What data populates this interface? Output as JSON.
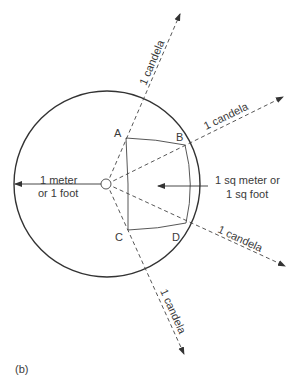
{
  "diagram": {
    "caption": "(b)",
    "points": {
      "A": "A",
      "B": "B",
      "C": "C",
      "D": "D"
    },
    "rays": [
      {
        "label": "1 candela",
        "direction": "up"
      },
      {
        "label": "1 candela",
        "direction": "upper-right"
      },
      {
        "label": "1 candela",
        "direction": "lower-right"
      },
      {
        "label": "1 candela",
        "direction": "down"
      }
    ],
    "radius_label": {
      "line1": "1 meter",
      "line2": "or 1 foot"
    },
    "area_label": {
      "line1": "1 sq meter or",
      "line2": "1 sq foot"
    },
    "colors": {
      "stroke": "#333333",
      "text": "#3a3a3a",
      "background": "#ffffff"
    }
  }
}
